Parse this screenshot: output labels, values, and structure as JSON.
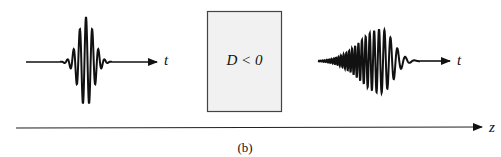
{
  "diagram": {
    "type": "pulse-propagation-through-dispersive-medium",
    "medium": {
      "label": "D < 0",
      "fill_color": "#f1f1f1",
      "border_color": "#444444"
    },
    "input_pulse": {
      "description": "symmetric unchirped wave packet",
      "axis_label": "t"
    },
    "output_pulse": {
      "description": "broadened chirped wave packet (high frequencies lead, low frequencies trail)",
      "axis_label": "t"
    },
    "propagation_axis": {
      "label": "z"
    },
    "caption": "(b)"
  }
}
